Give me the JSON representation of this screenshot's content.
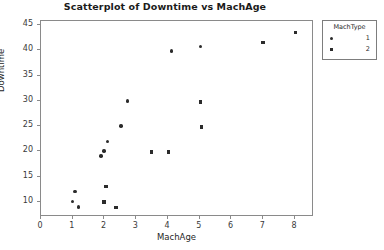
{
  "chart_data": {
    "type": "scatter",
    "title": "Scatterplot of Downtime vs MachAge",
    "xlabel": "MachAge",
    "ylabel": "Downtime",
    "xlim": [
      0,
      8.6
    ],
    "ylim": [
      7,
      45.8
    ],
    "xticks": [
      "0",
      "1",
      "2",
      "3",
      "4",
      "5",
      "6",
      "7",
      "8"
    ],
    "xtick_values": [
      0,
      1,
      2,
      3,
      4,
      5,
      6,
      7,
      8
    ],
    "yticks": [
      "10",
      "15",
      "20",
      "25",
      "30",
      "35",
      "40",
      "45"
    ],
    "ytick_values": [
      10,
      15,
      20,
      25,
      30,
      35,
      40,
      45
    ],
    "grid": false,
    "legend": {
      "title": "MachType",
      "position": "right-top",
      "entries": [
        {
          "label": "1",
          "marker": "circle"
        },
        {
          "label": "2",
          "marker": "square"
        }
      ]
    },
    "series": [
      {
        "name": "1",
        "marker": "circle",
        "points": [
          {
            "x": 1.02,
            "y": 9.9
          },
          {
            "x": 1.1,
            "y": 11.9
          },
          {
            "x": 1.22,
            "y": 8.8
          },
          {
            "x": 1.92,
            "y": 18.9
          },
          {
            "x": 2.02,
            "y": 19.9
          },
          {
            "x": 2.12,
            "y": 21.8
          },
          {
            "x": 2.55,
            "y": 24.8
          },
          {
            "x": 2.75,
            "y": 29.8
          },
          {
            "x": 4.15,
            "y": 39.7
          },
          {
            "x": 5.05,
            "y": 40.5
          }
        ]
      },
      {
        "name": "2",
        "marker": "square",
        "points": [
          {
            "x": 2.02,
            "y": 9.8
          },
          {
            "x": 2.08,
            "y": 12.8
          },
          {
            "x": 2.4,
            "y": 8.7
          },
          {
            "x": 3.52,
            "y": 19.7
          },
          {
            "x": 4.05,
            "y": 19.7
          },
          {
            "x": 5.08,
            "y": 24.6
          },
          {
            "x": 5.05,
            "y": 29.6
          },
          {
            "x": 7.02,
            "y": 41.4
          },
          {
            "x": 8.05,
            "y": 43.3
          }
        ]
      }
    ]
  },
  "artifacts": {
    "top_right_faint": ""
  }
}
